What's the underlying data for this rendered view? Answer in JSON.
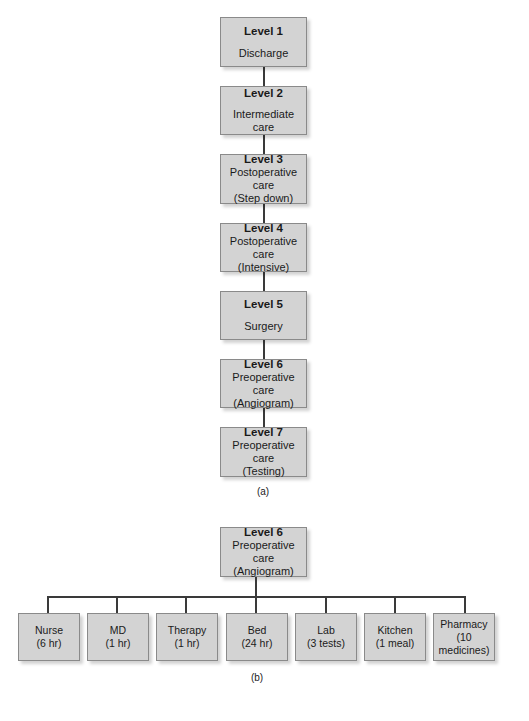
{
  "diagram_a": {
    "caption": "(a)",
    "levels": [
      {
        "title": "Level 1",
        "lines": [
          "Discharge"
        ]
      },
      {
        "title": "Level 2",
        "lines": [
          "Intermediate care"
        ]
      },
      {
        "title": "Level 3",
        "lines": [
          "Postoperative care",
          "(Step down)"
        ]
      },
      {
        "title": "Level 4",
        "lines": [
          "Postoperative care",
          "(Intensive)"
        ]
      },
      {
        "title": "Level 5",
        "lines": [
          "Surgery"
        ]
      },
      {
        "title": "Level 6",
        "lines": [
          "Preoperative care",
          "(Angiogram)"
        ]
      },
      {
        "title": "Level 7",
        "lines": [
          "Preoperative care",
          "(Testing)"
        ]
      }
    ]
  },
  "diagram_b": {
    "caption": "(b)",
    "root": {
      "title": "Level 6",
      "lines": [
        "Preoperative care",
        "(Angiogram)"
      ]
    },
    "children": [
      {
        "lines": [
          "Nurse",
          "(6 hr)"
        ]
      },
      {
        "lines": [
          "MD",
          "(1 hr)"
        ]
      },
      {
        "lines": [
          "Therapy",
          "(1 hr)"
        ]
      },
      {
        "lines": [
          "Bed",
          "(24 hr)"
        ]
      },
      {
        "lines": [
          "Lab",
          "(3 tests)"
        ]
      },
      {
        "lines": [
          "Kitchen",
          "(1 meal)"
        ]
      },
      {
        "lines": [
          "Pharmacy",
          "(10",
          "medicines)"
        ]
      }
    ]
  }
}
